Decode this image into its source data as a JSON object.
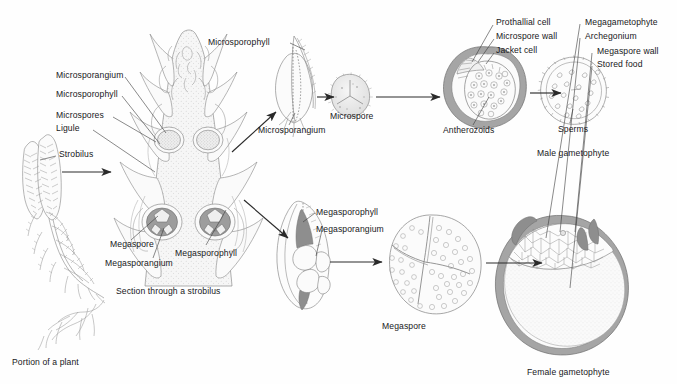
{
  "figure": {
    "background": "#fefefe",
    "ink": "#18181b",
    "line_gray": "#8a8a8a",
    "fill_light": "#f2f2f2",
    "fill_mid": "#d9d9d9",
    "fill_dark": "#a8a8a8"
  },
  "labels": {
    "microsporangium_strobilus": "Microsporangium",
    "microsporophyll_strobilus": "Microsporophyll",
    "microspores": "Microspores",
    "ligule": "Ligule",
    "strobilus": "Strobilus",
    "microsporophyll_detail": "Microsporophyll",
    "microsporangium_detail": "Microsporangium",
    "microspore": "Microspore",
    "prothallial_cell": "Prothallial cell",
    "microspore_wall": "Microspore wall",
    "jacket_cell": "Jacket cell",
    "antherozoids": "Antherozoids",
    "sperms": "Sperms",
    "megaspore_strobilus": "Megaspore",
    "megasporangium_strobilus": "Megasporangium",
    "megasporophyll_strobilus": "Megasporophyll",
    "megasporophyll_detail": "Megasporophyll",
    "megasporangium_detail": "Megasporangium",
    "megaspore": "Megaspore",
    "megagametophyte": "Megagametophyte",
    "archegonium": "Archegonium",
    "megaspore_wall": "Megaspore wall",
    "stored_food": "Stored food"
  },
  "captions": {
    "portion_of_plant": "Portion of a plant",
    "section_through_strobilus": "Section through a strobilus",
    "male_gametophyte": "Male gametophyte",
    "female_gametophyte": "Female gametophyte"
  },
  "stages": [
    {
      "id": "plant",
      "caption": "Portion of a plant"
    },
    {
      "id": "strobilus-section",
      "caption": "Section through a strobilus"
    },
    {
      "id": "microsporophyll",
      "caption": "Microsporophyll"
    },
    {
      "id": "microspore",
      "caption": "Microspore"
    },
    {
      "id": "male-gametophyte",
      "caption": "Male gametophyte"
    },
    {
      "id": "sperms",
      "caption": "Sperms"
    },
    {
      "id": "megasporophyll",
      "caption": "Megasporophyll"
    },
    {
      "id": "megaspore",
      "caption": "Megaspore"
    },
    {
      "id": "female-gametophyte",
      "caption": "Female gametophyte"
    }
  ]
}
